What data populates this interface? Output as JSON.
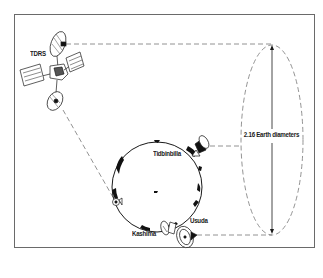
{
  "diagram": {
    "labels": {
      "tdrs": "TDRS",
      "tidbinbilla": "Tidbinbilla",
      "usuda": "Usuda",
      "kashima": "Kashima",
      "dimension": "2.16 Earth diameters"
    },
    "elements": [
      {
        "id": "tdrs",
        "type": "satellite",
        "label": "TDRS"
      },
      {
        "id": "earth",
        "type": "globe"
      },
      {
        "id": "tidbinbilla",
        "type": "ground-antenna",
        "label": "Tidbinbilla"
      },
      {
        "id": "usuda",
        "type": "ground-antenna",
        "label": "Usuda"
      },
      {
        "id": "kashima",
        "type": "ground-antenna",
        "label": "Kashima"
      },
      {
        "id": "baseline-ellipse",
        "type": "dashed-ellipse",
        "label": "2.16 Earth diameters"
      }
    ],
    "connections": [
      {
        "from": "tdrs",
        "to": "baseline-ellipse-top",
        "style": "dashed"
      },
      {
        "from": "tdrs",
        "to": "ground-antenna-west",
        "style": "dashed"
      },
      {
        "from": "tidbinbilla",
        "to": "baseline-ellipse-mid",
        "style": "dashed"
      },
      {
        "from": "usuda",
        "to": "baseline-ellipse-bottom",
        "style": "dashed"
      }
    ],
    "colors": {
      "ink": "#1a1a1a",
      "dash": "#777777",
      "border": "#6a6a6a",
      "background": "#ffffff"
    }
  }
}
